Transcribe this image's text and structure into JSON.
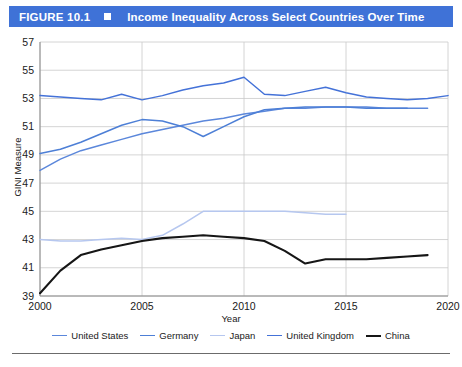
{
  "figure": {
    "number": "FIGURE 10.1",
    "marker_icon": "square-marker-icon",
    "title": "Income Inequality Across Select Countries Over Time"
  },
  "chart_data": {
    "type": "line",
    "title": "Income Inequality Across Select Countries Over Time",
    "xlabel": "Year",
    "ylabel": "GINI Measure",
    "xlim": [
      2000,
      2020
    ],
    "ylim": [
      39,
      57
    ],
    "xticks": [
      2000,
      2005,
      2010,
      2015,
      2020
    ],
    "yticks": [
      39,
      41,
      43,
      45,
      47,
      49,
      51,
      53,
      55,
      57
    ],
    "grid": true,
    "legend_position": "bottom",
    "series": [
      {
        "name": "United States",
        "color": "#5b87db",
        "x": [
          2000,
          2001,
          2002,
          2003,
          2004,
          2005,
          2006,
          2007,
          2008,
          2009,
          2010,
          2011,
          2012,
          2013,
          2014,
          2015,
          2016,
          2017,
          2018,
          2019
        ],
        "values": [
          47.9,
          48.7,
          49.3,
          49.7,
          50.1,
          50.5,
          50.8,
          51.1,
          51.4,
          51.6,
          51.9,
          52.1,
          52.3,
          52.3,
          52.4,
          52.4,
          52.4,
          52.3,
          52.3,
          52.3
        ]
      },
      {
        "name": "Germany",
        "color": "#4d7fd6",
        "x": [
          2000,
          2001,
          2002,
          2003,
          2004,
          2005,
          2006,
          2007,
          2008,
          2009,
          2010,
          2011,
          2012,
          2013,
          2014,
          2015,
          2016,
          2017,
          2018
        ],
        "values": [
          49.1,
          49.4,
          49.9,
          50.5,
          51.1,
          51.5,
          51.4,
          51.0,
          50.3,
          51.0,
          51.7,
          52.2,
          52.3,
          52.4,
          52.4,
          52.4,
          52.3,
          52.3,
          52.3
        ]
      },
      {
        "name": "Japan",
        "color": "#b6c7ef",
        "x": [
          2000,
          2001,
          2002,
          2003,
          2004,
          2005,
          2006,
          2007,
          2008,
          2009,
          2010,
          2011,
          2012,
          2013,
          2014,
          2015
        ],
        "values": [
          43.0,
          42.9,
          42.9,
          43.0,
          43.1,
          43.0,
          43.3,
          44.1,
          45.0,
          45.0,
          45.0,
          45.0,
          45.0,
          44.9,
          44.8,
          44.8
        ]
      },
      {
        "name": "United Kingdom",
        "color": "#4472d8",
        "x": [
          2000,
          2001,
          2002,
          2003,
          2004,
          2005,
          2006,
          2007,
          2008,
          2009,
          2010,
          2011,
          2012,
          2013,
          2014,
          2015,
          2016,
          2017,
          2018,
          2019,
          2020
        ],
        "values": [
          53.2,
          53.1,
          53.0,
          52.9,
          53.3,
          52.9,
          53.2,
          53.6,
          53.9,
          54.1,
          54.5,
          53.3,
          53.2,
          53.5,
          53.8,
          53.4,
          53.1,
          53.0,
          52.9,
          53.0,
          53.2
        ]
      },
      {
        "name": "China",
        "color": "#161616",
        "x": [
          2000,
          2001,
          2002,
          2003,
          2004,
          2005,
          2006,
          2007,
          2008,
          2009,
          2010,
          2011,
          2012,
          2013,
          2014,
          2015,
          2016,
          2017,
          2018,
          2019
        ],
        "values": [
          39.2,
          40.8,
          41.9,
          42.3,
          42.6,
          42.9,
          43.1,
          43.2,
          43.3,
          43.2,
          43.1,
          42.9,
          42.2,
          41.3,
          41.6,
          41.6,
          41.6,
          41.7,
          41.8,
          41.9
        ]
      }
    ]
  }
}
